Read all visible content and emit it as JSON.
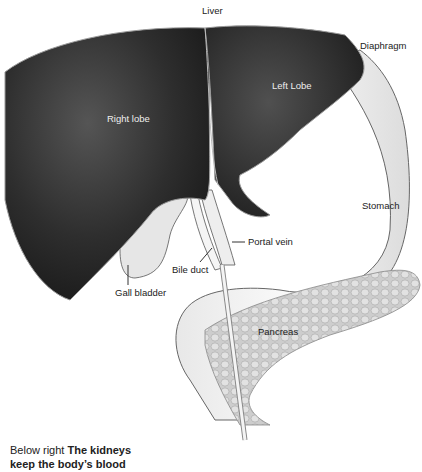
{
  "diagram": {
    "title": "Liver",
    "labels": {
      "liver": "Liver",
      "diaphragm": "Diaphragm",
      "left_lobe": "Left Lobe",
      "right_lobe": "Right lobe",
      "stomach": "Stomach",
      "portal_vein": "Portal vein",
      "bile_duct": "Bile duct",
      "gall_bladder": "Gall bladder",
      "pancreas": "Pancreas"
    },
    "colors": {
      "liver": "#2a2a2a",
      "stomach": "#f4f4f4",
      "pancreas": "#cfcfcf",
      "outline": "#555555"
    }
  },
  "caption": {
    "prefix": "Below right",
    "bold_line1": "The kidneys",
    "bold_line2": "keep the body’s blood"
  }
}
